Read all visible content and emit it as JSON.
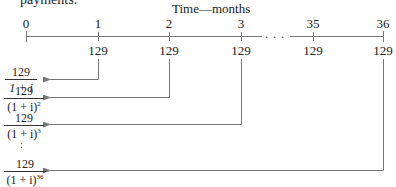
{
  "header": {
    "cut_text": "payments.",
    "axis_title": "Time—months"
  },
  "timeline": {
    "ticks": [
      {
        "label": "0",
        "x": 26,
        "payment": null
      },
      {
        "label": "1",
        "x": 98,
        "payment": "129"
      },
      {
        "label": "2",
        "x": 169,
        "payment": "129"
      },
      {
        "label": "3",
        "x": 241,
        "payment": "129"
      },
      {
        "label": "35",
        "x": 313,
        "payment": "129"
      },
      {
        "label": "36",
        "x": 383,
        "payment": "129"
      }
    ],
    "ellipsis": ". . .",
    "line_color": "#777777"
  },
  "present_values": [
    {
      "numerator": "129",
      "denominator_base": "1 + i",
      "exponent": "",
      "from_tick": "1"
    },
    {
      "numerator": "129",
      "denominator_base": "(1 + i)",
      "exponent": "2",
      "from_tick": "2"
    },
    {
      "numerator": "129",
      "denominator_base": "(1 + i)",
      "exponent": "3",
      "from_tick": "3"
    },
    {
      "numerator": "129",
      "denominator_base": "(1 + i)",
      "exponent": "36",
      "from_tick": "36"
    }
  ],
  "vertical_dots": ":"
}
